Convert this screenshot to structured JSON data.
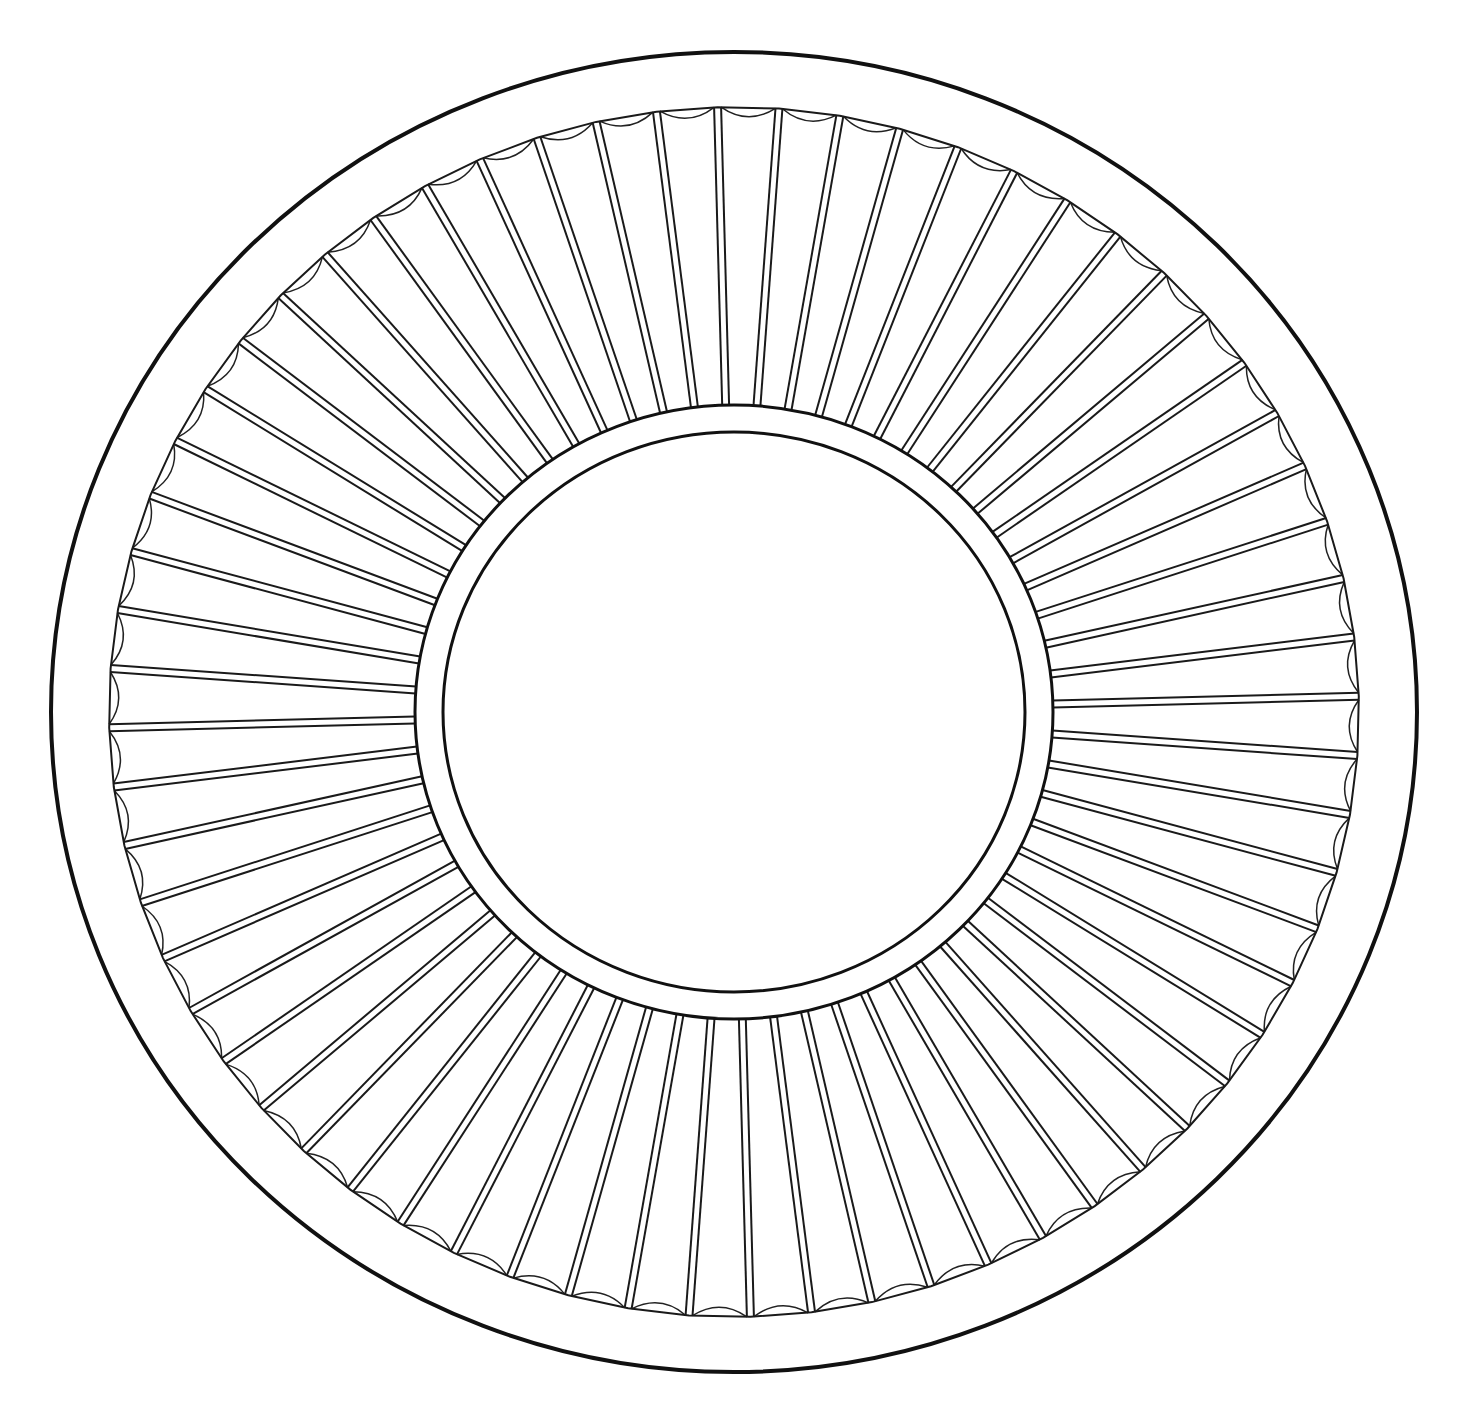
{
  "figure": {
    "background_color": "#ffffff",
    "line_color": "#111111",
    "canvas": {
      "width": 1465,
      "height": 1418
    },
    "center": {
      "x": 734,
      "y": 712
    }
  },
  "rings": {
    "outer_rim": {
      "rx": 683,
      "ry": 660
    },
    "scallop_band_outer": {
      "rx": 625,
      "ry": 605
    },
    "inner_ring_outer": {
      "rx": 319,
      "ry": 307
    },
    "inner_ring_inner": {
      "rx": 291,
      "ry": 280
    }
  },
  "spokes": {
    "count": 64,
    "strip_width": 7,
    "start_angle_deg": -91.5,
    "scallop_depth": 9
  }
}
